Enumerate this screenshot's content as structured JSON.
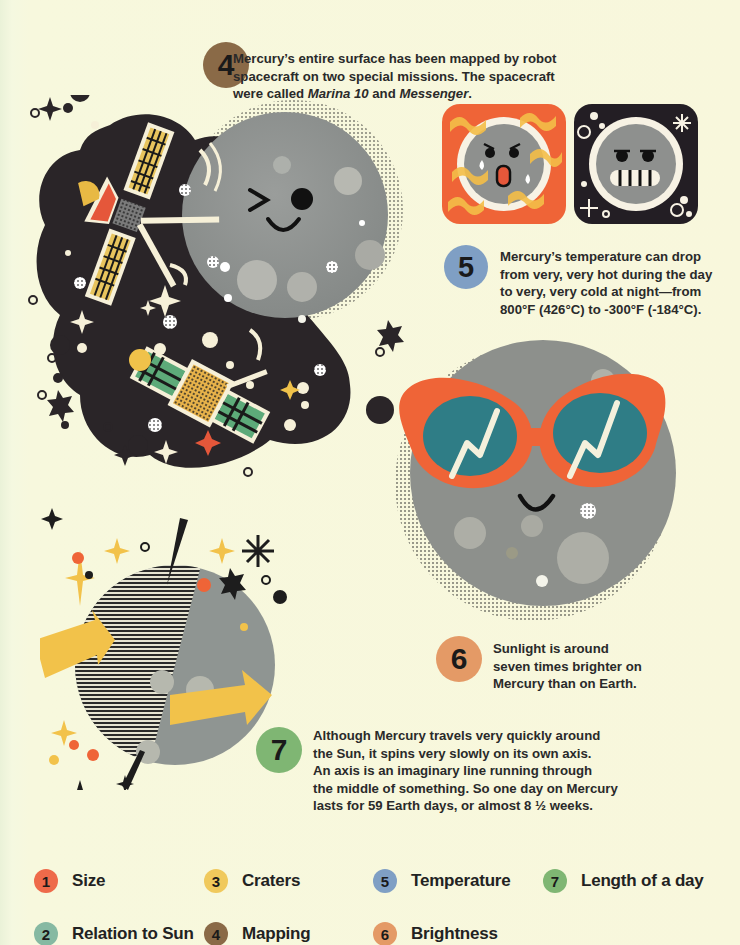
{
  "facts": [
    {
      "number": "4",
      "color": "#8a6a47",
      "text_before": "Mercury’s entire surface has been mapped by robot spacecraft on two special missions. The spacecraft were called ",
      "italic_1": "Marina 10",
      "text_mid": " and ",
      "italic_2": "Messenger",
      "text_after": "."
    },
    {
      "number": "5",
      "color": "#7f9fc4",
      "lines": [
        "Mercury’s temperature can drop",
        "from very, very hot during the day",
        "to very, very cold at night—from",
        "800°F (426°C) to -300°F (-184°C)."
      ]
    },
    {
      "number": "6",
      "color": "#e49a66",
      "lines": [
        "Sunlight is around",
        "seven times brighter on",
        "Mercury than on Earth."
      ]
    },
    {
      "number": "7",
      "color": "#7fb673",
      "lines": [
        "Although Mercury travels very quickly around",
        "the Sun, it spins very slowly on its own axis.",
        "An axis is an imaginary line running through",
        "the middle of something. So one day on Mercury",
        "lasts for 59 Earth days, or almost 8 ½ weeks."
      ]
    }
  ],
  "legend": [
    {
      "number": "1",
      "label": "Size",
      "color": "#ee6a4a"
    },
    {
      "number": "2",
      "label": "Relation to Sun",
      "color": "#86b9a2"
    },
    {
      "number": "3",
      "label": "Craters",
      "color": "#f0c95c"
    },
    {
      "number": "4",
      "label": "Mapping",
      "color": "#8a6a47"
    },
    {
      "number": "5",
      "label": "Temperature",
      "color": "#7f9fc4"
    },
    {
      "number": "6",
      "label": "Brightness",
      "color": "#e49a66"
    },
    {
      "number": "7",
      "label": "Length of a day",
      "color": "#7fb673"
    }
  ],
  "illustrations": {
    "mapping": "spacecraft-mapping-winking-mercury",
    "temperature_hot": "hot-mercury-face-icon",
    "temperature_cold": "cold-mercury-face-icon",
    "brightness": "mercury-with-sunglasses",
    "day_length": "rotating-mercury-with-arrows"
  },
  "colors": {
    "background": "#f7f8dd",
    "planet_gray": "#8f9290",
    "space_dark": "#2a2528",
    "orange": "#ef6437",
    "yellow": "#f2c24a",
    "teal": "#2f7d86"
  }
}
